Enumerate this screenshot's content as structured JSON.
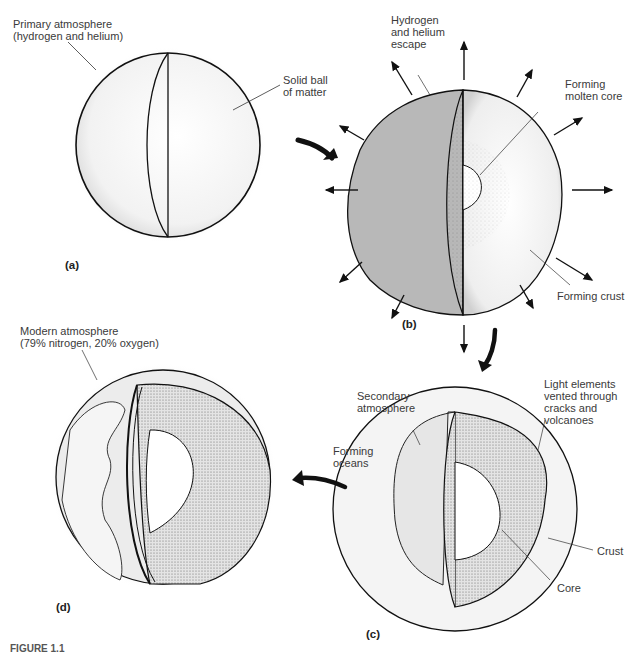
{
  "figure": {
    "caption_partial": "FIGURE 1.1",
    "panels": [
      {
        "id": "a",
        "label": "(a)",
        "annotations": [
          "Primary atmosphere\n(hydrogen and helium)",
          "Solid ball\nof matter"
        ]
      },
      {
        "id": "b",
        "label": "(b)",
        "annotations": [
          "Hydrogen\nand helium\nescape",
          "Forming\nmolten core",
          "Forming crust"
        ]
      },
      {
        "id": "c",
        "label": "(c)",
        "annotations": [
          "Secondary\natmosphere",
          "Light elements\nvented through\ncracks and\nvolcanoes",
          "Forming\noceans",
          "Crust",
          "Core"
        ]
      },
      {
        "id": "d",
        "label": "(d)",
        "annotations": [
          "Modern atmosphere\n(79% nitrogen, 20% oxygen)"
        ]
      }
    ],
    "sequence": [
      "a",
      "b",
      "c",
      "d"
    ]
  }
}
